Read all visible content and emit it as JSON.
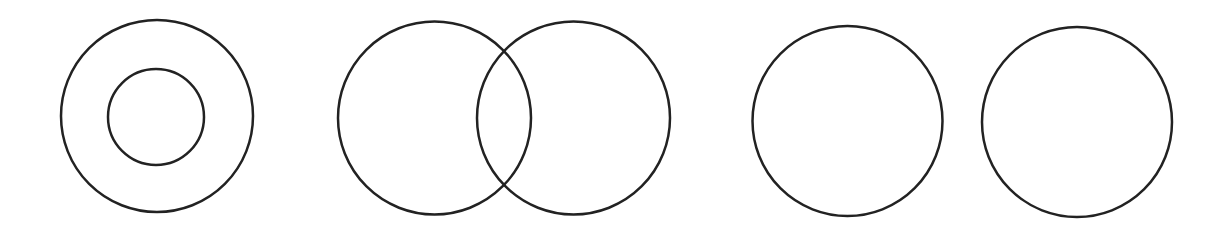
{
  "canvas": {
    "width": 1227,
    "height": 233,
    "background": "#ffffff"
  },
  "style": {
    "stroke": "#222222",
    "stroke_width": 2.5
  },
  "diagrams": [
    {
      "name": "concentric-circles",
      "circles": [
        {
          "cx": 157,
          "cy": 116,
          "r": 96
        },
        {
          "cx": 156,
          "cy": 117,
          "r": 48
        }
      ]
    },
    {
      "name": "overlapping-circles",
      "circles": [
        {
          "cx": 434.5,
          "cy": 118,
          "r": 96.5
        },
        {
          "cx": 573.5,
          "cy": 118,
          "r": 96.5
        }
      ]
    },
    {
      "name": "separate-circles",
      "circles": [
        {
          "cx": 847.5,
          "cy": 121,
          "r": 95
        },
        {
          "cx": 1077,
          "cy": 122,
          "r": 95
        }
      ]
    }
  ]
}
